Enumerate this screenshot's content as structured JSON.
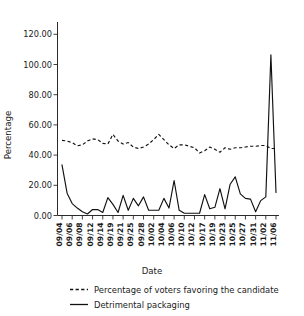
{
  "chart_data": {
    "type": "line",
    "title": "",
    "xlabel": "Date",
    "ylabel": "Percentage",
    "ylim": [
      0,
      130
    ],
    "yticks": [
      0,
      20,
      40,
      60,
      80,
      100,
      120
    ],
    "ytick_labels": [
      "0.00",
      "20.00",
      "40.00",
      "60.00",
      "80.00",
      "100.00",
      "120.00"
    ],
    "grid": false,
    "legend_position": "bottom",
    "x": [
      "09/04",
      "09/05",
      "09/06",
      "09/07",
      "09/08",
      "09/11",
      "09/12",
      "09/13",
      "09/14",
      "09/18",
      "09/19",
      "09/20",
      "09/21",
      "09/24",
      "09/25",
      "09/27",
      "09/28",
      "10/01",
      "10/02",
      "10/03",
      "10/04",
      "10/05",
      "10/06",
      "10/09",
      "10/10",
      "10/11",
      "10/12",
      "10/16",
      "10/17",
      "10/18",
      "10/19",
      "10/22",
      "10/23",
      "10/24",
      "10/25",
      "10/26",
      "10/27",
      "10/30",
      "10/31",
      "11/01",
      "11/02",
      "11/04",
      "11/06"
    ],
    "xtick_labels": [
      "09/04",
      "09/06",
      "09/08",
      "09/12",
      "09/14",
      "09/19",
      "09/21",
      "09/25",
      "09/28",
      "10/02",
      "10/04",
      "10/06",
      "10/10",
      "10/12",
      "10/17",
      "10/19",
      "10/23",
      "10/25",
      "10/27",
      "10/31",
      "11/02",
      "11/06"
    ],
    "series": [
      {
        "name": "Percentage of voters favoring the candidate",
        "style": "dashed",
        "values": [
          50.5,
          50.0,
          49.0,
          46.8,
          47.5,
          50.0,
          51.5,
          51.0,
          48.5,
          48.0,
          54.5,
          50.0,
          48.0,
          49.0,
          46.0,
          45.0,
          46.0,
          48.0,
          51.0,
          54.5,
          51.0,
          47.5,
          45.0,
          47.5,
          47.5,
          46.5,
          45.5,
          42.0,
          43.5,
          46.0,
          44.5,
          42.5,
          45.5,
          44.5,
          45.5,
          45.5,
          46.0,
          46.5,
          46.5,
          47.0,
          47.0,
          45.0,
          45.0
        ]
      },
      {
        "name": "Detrimental packaging",
        "style": "solid",
        "values": [
          34.0,
          15.0,
          8.0,
          5.0,
          2.5,
          1.0,
          4.0,
          4.0,
          2.0,
          12.0,
          7.5,
          2.0,
          13.5,
          3.5,
          11.5,
          6.5,
          12.5,
          3.5,
          3.5,
          3.5,
          11.5,
          5.0,
          23.5,
          3.5,
          1.5,
          1.5,
          1.5,
          1.5,
          14.0,
          4.5,
          5.5,
          18.0,
          4.5,
          21.0,
          26.0,
          14.5,
          11.5,
          11.0,
          2.5,
          10.0,
          12.5,
          108.0,
          15.5
        ]
      }
    ]
  },
  "legend": {
    "items": [
      {
        "label": "Percentage of voters favoring the candidate",
        "style": "dashed"
      },
      {
        "label": "Detrimental packaging",
        "style": "solid"
      }
    ]
  }
}
